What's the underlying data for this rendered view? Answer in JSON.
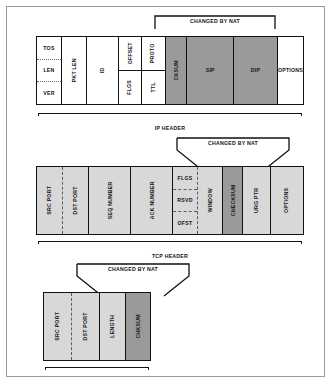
{
  "diagram": {
    "nat_note": "CHANGED BY NAT",
    "colors": {
      "highlight_ip": "#9a9a9a",
      "tcp_field": "#d8d8d8",
      "checksum_dark": "#9a9a9a",
      "plain": "#ffffff",
      "border": "#111111",
      "frame": "#9b9b9b"
    }
  },
  "sections": [
    {
      "id": "ip",
      "caption": "IP HEADER",
      "callout": "CHANGED BY NAT",
      "fields": [
        {
          "name": "tos-len-ver",
          "stacked": [
            "TOS",
            "LEN",
            "VER"
          ],
          "orient": "horizontal",
          "fill": "none"
        },
        {
          "name": "pkt-len",
          "label": "PKT LEN",
          "orient": "vertical",
          "fill": "none"
        },
        {
          "name": "id",
          "label": "ID",
          "orient": "vertical",
          "fill": "none"
        },
        {
          "name": "offset-flgs",
          "stacked": [
            "OFFSET",
            "FLGS"
          ],
          "orient": "vertical",
          "fill": "none"
        },
        {
          "name": "proto-ttl",
          "stacked": [
            "PROTO",
            "TTL"
          ],
          "orient": "vertical",
          "fill": "none"
        },
        {
          "name": "cksum",
          "label": "CKSUM",
          "orient": "vertical",
          "fill": "mid"
        },
        {
          "name": "sip",
          "label": "SIP",
          "orient": "horizontal",
          "fill": "mid"
        },
        {
          "name": "dip",
          "label": "DIP",
          "orient": "horizontal",
          "fill": "mid"
        },
        {
          "name": "options",
          "label": "OPTIONS",
          "orient": "horizontal",
          "fill": "none"
        }
      ]
    },
    {
      "id": "tcp",
      "caption": "TCP HEADER",
      "callout": "CHANGED BY NAT",
      "fields": [
        {
          "name": "src-port",
          "label": "SRC PORT",
          "orient": "vertical",
          "fill": "light"
        },
        {
          "name": "dst-port",
          "label": "DST PORT",
          "orient": "vertical",
          "fill": "light"
        },
        {
          "name": "seq-number",
          "label": "SEQ NUMBER",
          "orient": "vertical",
          "fill": "light"
        },
        {
          "name": "ack-number",
          "label": "ACK NUMBER",
          "orient": "vertical",
          "fill": "light"
        },
        {
          "name": "flgs-rsvd-ofst",
          "stacked": [
            "FLGS",
            "RSVD",
            "OFST"
          ],
          "orient": "horizontal",
          "fill": "light"
        },
        {
          "name": "window",
          "label": "WINDOW",
          "orient": "vertical",
          "fill": "light"
        },
        {
          "name": "checksum",
          "label": "CHECKSUM",
          "orient": "vertical",
          "fill": "dark"
        },
        {
          "name": "urg-ptr",
          "label": "URG PTR",
          "orient": "vertical",
          "fill": "light"
        },
        {
          "name": "options",
          "label": "OPTIONS",
          "orient": "vertical",
          "fill": "light"
        }
      ]
    },
    {
      "id": "udp",
      "caption": "UDP HEADER",
      "callout": "CHANGED BY NAT",
      "fields": [
        {
          "name": "src-port",
          "label": "SRC PORT",
          "orient": "vertical",
          "fill": "light"
        },
        {
          "name": "dst-port",
          "label": "DST PORT",
          "orient": "vertical",
          "fill": "light"
        },
        {
          "name": "length",
          "label": "LENGTH",
          "orient": "vertical",
          "fill": "light"
        },
        {
          "name": "chksum",
          "label": "CHKSUM",
          "orient": "vertical",
          "fill": "dark"
        }
      ]
    }
  ]
}
